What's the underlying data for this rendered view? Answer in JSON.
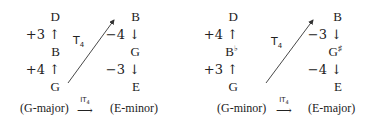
{
  "diagrams": [
    {
      "source": {
        "notes": [
          "D",
          "+3 ↑",
          "B",
          "+4 ↑",
          "G"
        ],
        "caption": "(G-major)"
      },
      "target": {
        "notes": [
          "B",
          "−4 ↓",
          "G",
          "−3 ↓",
          "E"
        ],
        "caption": "(E-minor)"
      },
      "transform_label": "T",
      "transform_sub": "4",
      "operator_label": "IT",
      "operator_sub": "4",
      "operator_arrow": "⟶"
    },
    {
      "source": {
        "notes": [
          "D",
          "+4 ↑",
          "B",
          "+3 ↑",
          "G"
        ],
        "accidentals": [
          "",
          "",
          "♭",
          "",
          ""
        ],
        "caption": "(G-minor)"
      },
      "target": {
        "notes": [
          "B",
          "−3 ↓",
          "G",
          "−4 ↓",
          "E"
        ],
        "accidentals": [
          "",
          "",
          "♯",
          "",
          ""
        ],
        "caption": "(E-major)"
      },
      "transform_label": "T",
      "transform_sub": "4",
      "operator_label": "IT",
      "operator_sub": "4",
      "operator_arrow": "⟶"
    }
  ],
  "colors": {
    "text": "#222222",
    "arrow": "#333333",
    "background": "#ffffff"
  }
}
